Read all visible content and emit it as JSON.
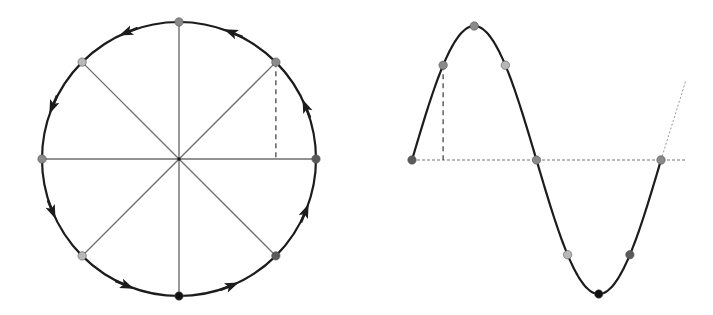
{
  "diagram": {
    "colors": {
      "stroke": "#1c1c1c",
      "spoke": "#6e6e6e",
      "dashed": "#555555",
      "axis_dotted": "#777777",
      "point_light": "#b8b8b8",
      "point_mid": "#8a8a8a",
      "point_dark": "#5a5a5a",
      "point_black": "#111111"
    },
    "circle": {
      "center": [
        179,
        159
      ],
      "radius": 137,
      "direction": "counter-clockwise",
      "points": [
        {
          "angle_deg": 0,
          "shade": "point_dark"
        },
        {
          "angle_deg": 45,
          "shade": "point_mid"
        },
        {
          "angle_deg": 90,
          "shade": "point_mid"
        },
        {
          "angle_deg": 135,
          "shade": "point_light"
        },
        {
          "angle_deg": 180,
          "shade": "point_mid"
        },
        {
          "angle_deg": 225,
          "shade": "point_light"
        },
        {
          "angle_deg": 270,
          "shade": "point_black"
        },
        {
          "angle_deg": 315,
          "shade": "point_dark"
        }
      ],
      "arrow_angles_deg": [
        22.5,
        67.5,
        112.5,
        157.5,
        202.5,
        247.5,
        292.5,
        337.5
      ],
      "projection_dashed_at_deg": 45
    },
    "sine_wave": {
      "origin": [
        412,
        160
      ],
      "period_px": 249,
      "amplitude_px": 134,
      "axis_end_x": 686,
      "dotted_continuation": [
        [
          661,
          160
        ],
        [
          686,
          80
        ]
      ],
      "points": [
        {
          "phase_deg": 0,
          "shade": "point_dark"
        },
        {
          "phase_deg": 45,
          "shade": "point_mid"
        },
        {
          "phase_deg": 90,
          "shade": "point_mid"
        },
        {
          "phase_deg": 135,
          "shade": "point_light"
        },
        {
          "phase_deg": 180,
          "shade": "point_mid"
        },
        {
          "phase_deg": 225,
          "shade": "point_light"
        },
        {
          "phase_deg": 270,
          "shade": "point_black"
        },
        {
          "phase_deg": 315,
          "shade": "point_dark"
        },
        {
          "phase_deg": 360,
          "shade": "point_mid"
        }
      ],
      "projection_dashed_at_deg": 45
    }
  }
}
